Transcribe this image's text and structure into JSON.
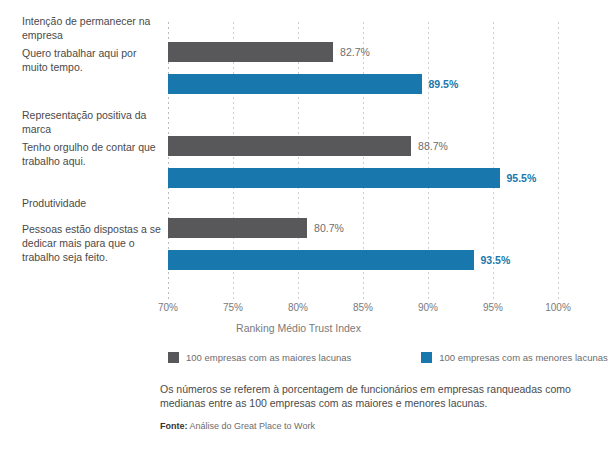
{
  "chart_data": {
    "type": "bar",
    "orientation": "horizontal",
    "title": "",
    "xlabel": "Ranking Médio Trust Index",
    "ylabel": "",
    "xlim": [
      70,
      100
    ],
    "xticks": [
      70,
      75,
      80,
      85,
      90,
      95,
      100
    ],
    "xtick_labels": [
      "70%",
      "75%",
      "80%",
      "85%",
      "90%",
      "95%",
      "100%"
    ],
    "grid": true,
    "legend_position": "bottom",
    "categories": [
      "Intenção de permanecer na empresa",
      "Representação positiva da marca",
      "Produtividade"
    ],
    "series": [
      {
        "name": "100 empresas com as maiores lacunas",
        "color": "#58585a",
        "values": [
          82.7,
          88.7,
          80.7
        ],
        "value_labels": [
          "82.7%",
          "88.7%",
          "80.7%"
        ]
      },
      {
        "name": "100 empresas com as menores lacunas",
        "color": "#1878ad",
        "values": [
          89.5,
          95.5,
          93.5
        ],
        "value_labels": [
          "89.5%",
          "95.5%",
          "93.5%"
        ]
      }
    ],
    "groups": [
      {
        "category_label": "Intenção de permanecer na empresa",
        "statement_label": "Quero trabalhar aqui por muito tempo.",
        "maiores": 82.7,
        "menores": 89.5
      },
      {
        "category_label": "Representação positiva da marca",
        "statement_label": "Tenho orgulho de contar que trabalho aqui.",
        "maiores": 88.7,
        "menores": 95.5
      },
      {
        "category_label": "Produtividade",
        "statement_label": "Pessoas estão dispostas a se dedicar mais para que o trabalho seja feito.",
        "maiores": 80.7,
        "menores": 93.5
      }
    ]
  },
  "axis": {
    "title": "Ranking Médio Trust Index",
    "tick_0": "70%",
    "tick_1": "75%",
    "tick_2": "80%",
    "tick_3": "85%",
    "tick_4": "90%",
    "tick_5": "95%",
    "tick_6": "100%"
  },
  "labels": {
    "group_0_category": "Intenção de permanecer na empresa",
    "group_0_statement": "Quero trabalhar aqui por muito tempo.",
    "group_1_category": "Representação positiva da marca",
    "group_1_statement": "Tenho orgulho de contar que trabalho aqui.",
    "group_2_category": "Produtividade",
    "group_2_statement": "Pessoas estão dispostas a se dedicar mais para que o trabalho seja feito."
  },
  "values": {
    "g0_maiores": "82.7%",
    "g0_menores": "89.5%",
    "g1_maiores": "88.7%",
    "g1_menores": "95.5%",
    "g2_maiores": "80.7%",
    "g2_menores": "93.5%"
  },
  "legend": {
    "maiores_label": "100 empresas com as maiores lacunas",
    "menores_label": "100 empresas com as menores lacunas"
  },
  "footnote": {
    "text": "Os números se referem à porcentagem de funcionários em empresas ranqueadas como medianas entre as 100 empresas com as maiores e menores lacunas."
  },
  "source": {
    "prefix": "Fonte:",
    "text": "Análise do Great Place to Work"
  },
  "colors": {
    "maiores": "#58585a",
    "menores": "#1878ad"
  }
}
